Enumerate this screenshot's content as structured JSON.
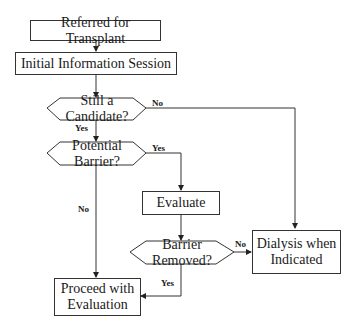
{
  "diagram": {
    "type": "flowchart",
    "nodes": {
      "referred": {
        "label": "Referred for Transplant",
        "shape": "rectangle"
      },
      "info_session": {
        "label": "Initial Information Session",
        "shape": "rectangle"
      },
      "still_candidate": {
        "label_line1": "Still a",
        "label_line2": "Candidate?",
        "shape": "hexagon-decision"
      },
      "potential_barrier": {
        "label_line1": "Potential",
        "label_line2": "Barrier?",
        "shape": "hexagon-decision"
      },
      "evaluate": {
        "label": "Evaluate",
        "shape": "rectangle"
      },
      "barrier_removed": {
        "label_line1": "Barrier",
        "label_line2": "Removed?",
        "shape": "hexagon-decision"
      },
      "dialysis": {
        "label_line1": "Dialysis when",
        "label_line2": "Indicated",
        "shape": "rectangle"
      },
      "proceed": {
        "label_line1": "Proceed with",
        "label_line2": "Evaluation",
        "shape": "rectangle"
      }
    },
    "edge_labels": {
      "candidate_no": "No",
      "candidate_yes": "Yes",
      "barrier_yes": "Yes",
      "barrier_no": "No",
      "removed_no": "No",
      "removed_yes": "Yes"
    },
    "edges": [
      {
        "from": "referred",
        "to": "info_session",
        "label": ""
      },
      {
        "from": "info_session",
        "to": "still_candidate",
        "label": ""
      },
      {
        "from": "still_candidate",
        "to": "dialysis",
        "label": "No"
      },
      {
        "from": "still_candidate",
        "to": "potential_barrier",
        "label": "Yes"
      },
      {
        "from": "potential_barrier",
        "to": "evaluate",
        "label": "Yes"
      },
      {
        "from": "potential_barrier",
        "to": "proceed",
        "label": "No"
      },
      {
        "from": "evaluate",
        "to": "barrier_removed",
        "label": ""
      },
      {
        "from": "barrier_removed",
        "to": "dialysis",
        "label": "No"
      },
      {
        "from": "barrier_removed",
        "to": "proceed",
        "label": "Yes"
      }
    ]
  }
}
